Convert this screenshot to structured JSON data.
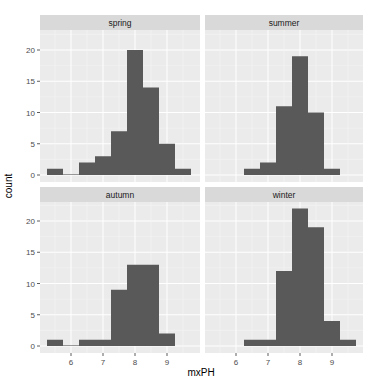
{
  "chart_data": {
    "type": "bar",
    "subtype": "faceted-histogram",
    "xlabel": "mxPH",
    "ylabel": "count",
    "x_ticks": [
      6,
      7,
      8,
      9
    ],
    "y_ticks": [
      0,
      5,
      10,
      15,
      20
    ],
    "xlim": [
      5.2,
      9.9
    ],
    "ylim": [
      0,
      23
    ],
    "binwidth": 0.5,
    "facets": [
      {
        "name": "spring",
        "bin_starts": [
          5.25,
          5.75,
          6.25,
          6.75,
          7.25,
          7.75,
          8.25,
          8.75,
          9.25
        ],
        "counts": [
          1,
          0,
          2,
          3,
          7,
          20,
          14,
          5,
          1
        ]
      },
      {
        "name": "summer",
        "bin_starts": [
          6.25,
          6.75,
          7.25,
          7.75,
          8.25,
          8.75
        ],
        "counts": [
          1,
          2,
          11,
          19,
          10,
          1
        ]
      },
      {
        "name": "autumn",
        "bin_starts": [
          5.25,
          5.75,
          6.25,
          6.75,
          7.25,
          7.75,
          8.25,
          8.75
        ],
        "counts": [
          1,
          0,
          1,
          1,
          9,
          13,
          13,
          2
        ]
      },
      {
        "name": "winter",
        "bin_starts": [
          6.25,
          6.75,
          7.25,
          7.75,
          8.25,
          8.75,
          9.25
        ],
        "counts": [
          1,
          1,
          12,
          22,
          19,
          4,
          1
        ]
      }
    ],
    "grid": true,
    "legend": null
  },
  "labels": {
    "xlabel": "mxPH",
    "ylabel": "count",
    "facet_spring": "spring",
    "facet_summer": "summer",
    "facet_autumn": "autumn",
    "facet_winter": "winter"
  },
  "colors": {
    "bar": "#595959",
    "panel": "#ebebeb",
    "strip": "#d9d9d9"
  }
}
